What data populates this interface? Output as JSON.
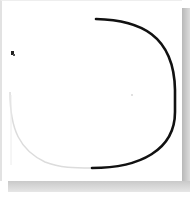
{
  "canvas": {
    "description": "Sketch on paper: rounded U-shaped curve",
    "stroke_color": "#111111",
    "faded_stroke_color": "#d8d8d8",
    "shadow_color": "#c4c4c4",
    "paper_color": "#ffffff"
  },
  "marker": {
    "icon": "cursor-marker-icon"
  }
}
